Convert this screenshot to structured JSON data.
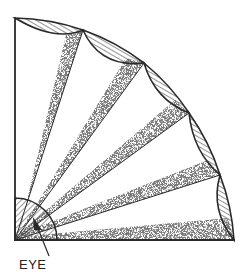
{
  "diagram": {
    "type": "quarter-circle visual field diagram",
    "label_eye": "EYE",
    "colors": {
      "ink": "#2a2a2a",
      "stipple": "#3a3a3a",
      "background": "#ffffff"
    },
    "geometry": {
      "origin": [
        15,
        240
      ],
      "radius": 222,
      "eye_radius": 42,
      "arc_nodes": [
        [
          15,
          18
        ],
        [
          83,
          30
        ],
        [
          144,
          63
        ],
        [
          189,
          113
        ],
        [
          220,
          175
        ],
        [
          234,
          240
        ]
      ],
      "segment_count": 5
    },
    "elements": [
      "quarter-circle frame (vertical and horizontal axes)",
      "5 hatched lens-shaped segments along the outer arc",
      "4 rays from eye to arc nodes with stippled shading",
      "hatched quarter-disc representing the eye",
      "arrow pointing to the eye"
    ]
  }
}
